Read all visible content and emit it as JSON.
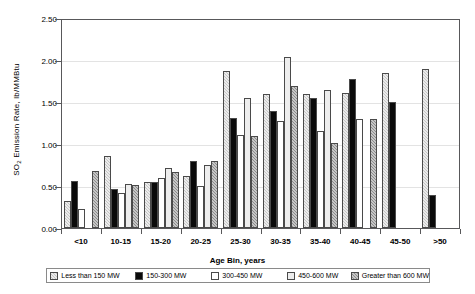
{
  "chart_data": {
    "type": "bar",
    "title": "",
    "xlabel": "Age Bin, years",
    "ylabel": "SO2 Emission Rate, lb/MMBtu",
    "ylabel_prefix": "SO",
    "ylabel_sub": "2",
    "ylabel_suffix": " Emission Rate, lb/MMBtu",
    "ylim": [
      0.0,
      2.5
    ],
    "yticks": [
      "0.00",
      "0.50",
      "1.00",
      "1.50",
      "2.00",
      "2.50"
    ],
    "ytick_values": [
      0.0,
      0.5,
      1.0,
      1.5,
      2.0,
      2.5
    ],
    "grid": true,
    "legend_position": "bottom",
    "categories": [
      "<10",
      "10-15",
      "15-20",
      "20-25",
      "25-30",
      "30-35",
      "35-40",
      "40-45",
      "45-50",
      ">50"
    ],
    "series": [
      {
        "name": "Less than 150 MW",
        "fill": "light-gray-hatch",
        "color": "#c6c6c6",
        "values": [
          0.33,
          0.86,
          0.55,
          0.62,
          1.89,
          1.61,
          1.61,
          1.62,
          1.86,
          1.91
        ]
      },
      {
        "name": "150-300 MW",
        "fill": "black-solid",
        "color": "#0a0a0a",
        "values": [
          0.57,
          0.47,
          0.55,
          0.8,
          1.32,
          1.41,
          1.56,
          1.79,
          1.51,
          0.4
        ]
      },
      {
        "name": "300-450 MW",
        "fill": "white",
        "color": "#ffffff",
        "values": [
          0.23,
          0.42,
          0.6,
          0.5,
          1.12,
          1.29,
          1.17,
          1.31,
          null,
          null
        ]
      },
      {
        "name": "450-600 MW",
        "fill": "very-light-gray",
        "color": "#ededed",
        "values": [
          null,
          0.53,
          0.72,
          0.76,
          1.56,
          2.05,
          1.66,
          null,
          null,
          null
        ]
      },
      {
        "name": "Greater than 600 MW",
        "fill": "dark-gray-hatch",
        "color": "#8c8c8c",
        "values": [
          0.69,
          0.52,
          0.67,
          0.81,
          1.11,
          1.71,
          1.02,
          1.31,
          null,
          null
        ]
      }
    ]
  },
  "legend": {
    "items": [
      {
        "label": "Less than 150 MW"
      },
      {
        "label": "150-300 MW"
      },
      {
        "label": "300-450 MW"
      },
      {
        "label": "450-600 MW"
      },
      {
        "label": "Greater than 600 MW"
      }
    ]
  }
}
